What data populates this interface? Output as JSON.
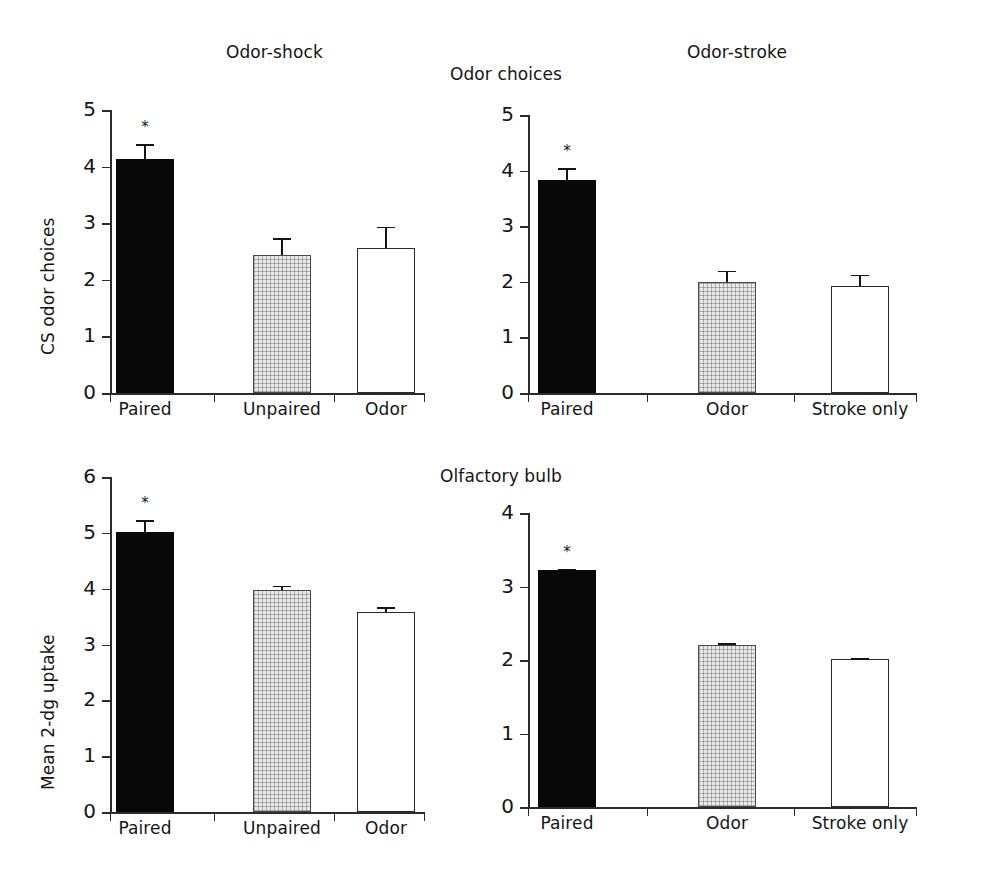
{
  "figure": {
    "row_titles": [
      "Odor choices",
      "Olfactory bulb"
    ],
    "column_titles": [
      "Odor-shock",
      "Odor-stroke"
    ],
    "significance_marker": "*"
  },
  "chart_data": [
    {
      "id": "odor-shock-choices",
      "type": "bar",
      "title": "Odor-shock",
      "row_title": "Odor choices",
      "xlabel": "",
      "ylabel": "CS odor choices",
      "ylim": [
        0,
        5
      ],
      "yticks": [
        0,
        1,
        2,
        3,
        4,
        5
      ],
      "ytick_labels": [
        "0",
        "1",
        "2",
        "3",
        "4",
        "5"
      ],
      "grid": false,
      "legend": "none",
      "categories": [
        "Paired",
        "Unpaired",
        "Odor"
      ],
      "values": [
        4.13,
        2.44,
        2.57
      ],
      "errors": [
        0.27,
        0.3,
        0.37
      ],
      "fills": [
        "solid",
        "hatch",
        "open"
      ],
      "significant": [
        true,
        false,
        false
      ]
    },
    {
      "id": "odor-stroke-choices",
      "type": "bar",
      "title": "Odor-stroke",
      "row_title": "Odor choices",
      "xlabel": "",
      "ylabel": "",
      "ylim": [
        0,
        5
      ],
      "yticks": [
        0,
        1,
        2,
        3,
        4,
        5
      ],
      "ytick_labels": [
        "0",
        "1",
        "2",
        "3",
        "4",
        "5"
      ],
      "grid": false,
      "legend": "none",
      "categories": [
        "Paired",
        "Odor",
        "Stroke only"
      ],
      "values": [
        3.83,
        2.0,
        1.92
      ],
      "errors": [
        0.21,
        0.2,
        0.21
      ],
      "fills": [
        "solid",
        "hatch",
        "open"
      ],
      "significant": [
        true,
        false,
        false
      ]
    },
    {
      "id": "odor-shock-bulb",
      "type": "bar",
      "title": "Odor-shock",
      "row_title": "Olfactory bulb",
      "xlabel": "",
      "ylabel": "Mean 2-dg uptake",
      "ylim": [
        0,
        6
      ],
      "yticks": [
        0,
        1,
        2,
        3,
        4,
        5,
        6
      ],
      "ytick_labels": [
        "0",
        "1",
        "2",
        "3",
        "4",
        "5",
        "6"
      ],
      "grid": false,
      "legend": "none",
      "categories": [
        "Paired",
        "Unpaired",
        "Odor"
      ],
      "values": [
        5.02,
        3.98,
        3.59
      ],
      "errors": [
        0.21,
        0.07,
        0.08
      ],
      "fills": [
        "solid",
        "hatch",
        "open"
      ],
      "significant": [
        true,
        false,
        false
      ]
    },
    {
      "id": "odor-stroke-bulb",
      "type": "bar",
      "title": "Odor-stroke",
      "row_title": "Olfactory bulb",
      "xlabel": "",
      "ylabel": "",
      "ylim": [
        0,
        4
      ],
      "yticks": [
        0,
        1,
        2,
        3,
        4
      ],
      "ytick_labels": [
        "0",
        "1",
        "2",
        "3",
        "4"
      ],
      "grid": false,
      "legend": "none",
      "categories": [
        "Paired",
        "Odor",
        "Stroke only"
      ],
      "values": [
        3.22,
        2.21,
        2.01
      ],
      "errors": [
        0.02,
        0.02,
        0.015
      ],
      "fills": [
        "solid",
        "hatch",
        "open"
      ],
      "significant": [
        true,
        false,
        false
      ]
    }
  ]
}
